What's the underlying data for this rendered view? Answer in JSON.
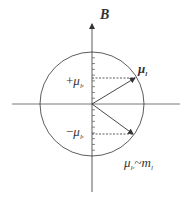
{
  "diagram": {
    "axis_label": "B",
    "vector_label": {
      "symbol": "μ",
      "subscript": "l"
    },
    "plus_projection_label": {
      "sign": "+",
      "symbol": "μ",
      "subscript": "l",
      "subsubscript": "z"
    },
    "minus_projection_label": {
      "sign": "−",
      "symbol": "μ",
      "subscript": "l",
      "subsubscript": "z"
    },
    "relation_label": {
      "lhs_symbol": "μ",
      "lhs_subscript": "l",
      "lhs_subsubscript": "z",
      "relation": "~",
      "rhs_symbol": "m",
      "rhs_subscript": "l"
    },
    "colors": {
      "stroke": "#333333",
      "background": "#ffffff"
    },
    "vectors": [
      {
        "name": "upper-moment",
        "angle_deg": 30
      },
      {
        "name": "lower-moment",
        "angle_deg": -35
      }
    ],
    "tick_count_per_half": 8
  }
}
